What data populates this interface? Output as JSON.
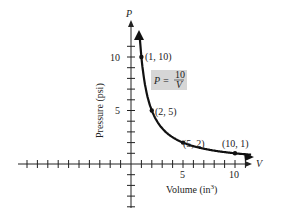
{
  "chart_data": {
    "type": "line",
    "title": "",
    "xlabel": "Volume (in³)",
    "ylabel": "Pressure (psi)",
    "x_axis_var": "V",
    "y_axis_var": "P",
    "x_ticks_labeled": [
      5,
      10
    ],
    "y_ticks_labeled": [
      5,
      10
    ],
    "xlim": [
      -10,
      11.5
    ],
    "ylim": [
      -4,
      13
    ],
    "grid": false,
    "equation": "P = 10/V",
    "series": [
      {
        "name": "P = 10/V",
        "x": [
          0.8,
          1,
          2,
          5,
          10,
          11.5
        ],
        "y": [
          12.5,
          10,
          5,
          2,
          1,
          0.87
        ]
      }
    ],
    "points": [
      {
        "label": "(1, 10)",
        "x": 1,
        "y": 10
      },
      {
        "label": "(2, 5)",
        "x": 2,
        "y": 5
      },
      {
        "label": "(5, 2)",
        "x": 5,
        "y": 2
      },
      {
        "label": "(10, 1)",
        "x": 10,
        "y": 1
      }
    ]
  },
  "labels": {
    "p_axis": "P",
    "v_axis": "V",
    "x_tick_5": "5",
    "x_tick_10": "10",
    "y_tick_5": "5",
    "y_tick_10": "10",
    "xlabel": "Volume (in",
    "xlabel_sup": "3",
    "xlabel_close": ")",
    "ylabel": "Pressure (psi)",
    "eq_lhs": "P = ",
    "eq_num": "10",
    "eq_den": "V",
    "pt1": "(1, 10)",
    "pt2": "(2, 5)",
    "pt3": "(5, 2)",
    "pt4": "(10, 1)"
  }
}
